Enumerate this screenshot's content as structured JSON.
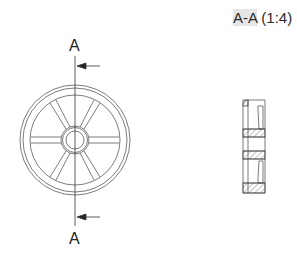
{
  "section_view": {
    "title_id": "A-A",
    "title_scale": "(1:4)"
  },
  "front_view": {
    "cut_label_top": "A",
    "cut_label_bottom": "A",
    "spokes": 8
  },
  "colors": {
    "line": "#3a3a3a",
    "title_highlight": "#e6e6e6"
  }
}
